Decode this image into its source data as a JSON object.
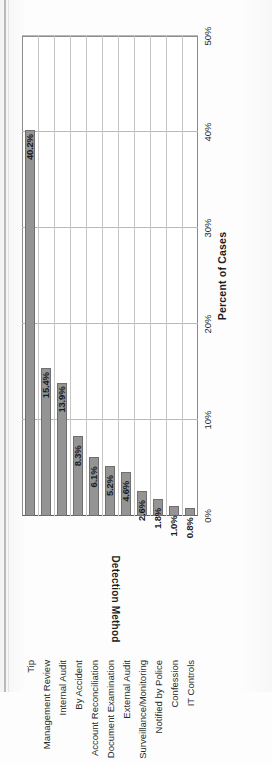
{
  "chart_data": {
    "type": "bar",
    "orientation": "horizontal",
    "title": "",
    "xlabel": "Percent of Cases",
    "ylabel": "Detection Method",
    "categories": [
      "Tip",
      "Management Review",
      "Internal Audit",
      "By Accident",
      "Account Reconciliation",
      "Document Examination",
      "External Audit",
      "Surveillance/Monitoring",
      "Notified by Police",
      "Confession",
      "IT Controls"
    ],
    "values": [
      40.2,
      15.4,
      13.9,
      8.3,
      6.1,
      5.2,
      4.6,
      2.6,
      1.8,
      1.0,
      0.8
    ],
    "data_labels": [
      "40.2%",
      "15.4%",
      "13.9%",
      "8.3%",
      "6.1%",
      "5.2%",
      "4.6%",
      "2.6%",
      "1.8%",
      "1.0%",
      "0.8%"
    ],
    "xlim": [
      0,
      50
    ],
    "xticks": [
      0,
      10,
      20,
      30,
      40,
      50
    ],
    "xtick_labels": [
      "0%",
      "10%",
      "20%",
      "30%",
      "40%",
      "50%"
    ],
    "grid": true,
    "grid_axis": "x",
    "legend": false,
    "bar_color": "#949494",
    "bar_border_color": "#6f6f6f",
    "grid_color": "#b9b9b9",
    "axis_color": "#5a5a5a",
    "text_color": "#2b2b2b",
    "label_color": "#1a1a1a",
    "background": "#ffffff",
    "page_background": "#fdfdfd"
  }
}
